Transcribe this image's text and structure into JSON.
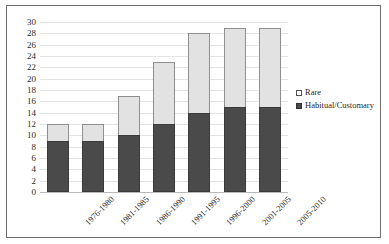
{
  "chart_data": {
    "type": "bar",
    "subtype": "stacked-column",
    "title": "",
    "xlabel": "",
    "ylabel": "",
    "categories": [
      "1976-1980",
      "1981-1985",
      "1986-1990",
      "1991-1995",
      "1996-2000",
      "2001-2005",
      "2005-2010"
    ],
    "series": [
      {
        "name": "Habitual/Customary",
        "color": "#4a4a4a",
        "values": [
          9,
          9,
          10,
          12,
          14,
          15,
          15
        ]
      },
      {
        "name": "Rare",
        "color": "#e2e2e2",
        "values": [
          3,
          3,
          7,
          11,
          14,
          14,
          14
        ]
      }
    ],
    "totals": [
      12,
      12,
      17,
      23,
      28,
      29,
      29
    ],
    "ylim": [
      0,
      30
    ],
    "ytick_step": 2,
    "yticks": [
      "30",
      "28",
      "26",
      "24",
      "22",
      "20",
      "18",
      "16",
      "14",
      "12",
      "10",
      "8",
      "6",
      "4",
      "2",
      "0"
    ],
    "grid": true,
    "grid_axis": "y",
    "legend_position": "right",
    "legend": [
      {
        "label": "Rare",
        "swatch": "light"
      },
      {
        "label": "Habitual/Customary",
        "swatch": "dark"
      }
    ]
  },
  "figure": {
    "frame_color": "#6d6d6d",
    "background": "#ffffff",
    "gridline_color": "#e3e3e3",
    "axis_color": "#b9b9b9",
    "text_color": "#2a2a2a"
  }
}
